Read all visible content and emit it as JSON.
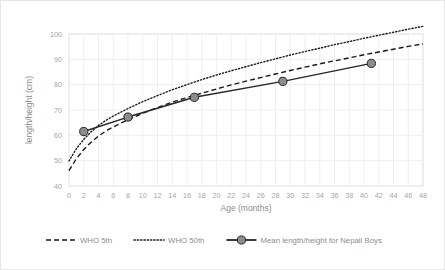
{
  "chart_data": {
    "type": "line",
    "title": "",
    "xlabel": "Age (months)",
    "ylabel": "length/height (cm)",
    "xlim": [
      0,
      48
    ],
    "ylim": [
      40,
      100
    ],
    "ytick_step": 10,
    "xtick_step": 2,
    "grid": "vertical-and-horizontal-light",
    "legend_position": "bottom",
    "xticks": [
      0,
      2,
      4,
      6,
      8,
      10,
      12,
      14,
      16,
      18,
      20,
      22,
      24,
      26,
      28,
      30,
      32,
      34,
      36,
      38,
      40,
      42,
      44,
      46,
      48
    ],
    "yticks": [
      40,
      50,
      60,
      70,
      80,
      90,
      100
    ],
    "series": [
      {
        "name": "WHO 5th",
        "style": "dashed",
        "color": "#1a1a1a",
        "x": [
          0,
          1,
          2,
          3,
          4,
          5,
          6,
          8,
          10,
          12,
          14,
          16,
          18,
          20,
          22,
          24,
          26,
          28,
          30,
          32,
          34,
          36,
          38,
          40,
          42,
          44,
          46,
          48
        ],
        "y": [
          46.1,
          50.8,
          54.4,
          57.3,
          59.7,
          61.7,
          63.3,
          66.2,
          68.7,
          71.0,
          73.1,
          74.9,
          76.6,
          78.3,
          79.9,
          81.4,
          82.8,
          84.2,
          85.6,
          86.9,
          88.2,
          89.4,
          90.6,
          91.8,
          92.9,
          94.0,
          95.1,
          96.1
        ]
      },
      {
        "name": "WHO 50th",
        "style": "dotted",
        "color": "#1a1a1a",
        "x": [
          0,
          1,
          2,
          3,
          4,
          5,
          6,
          8,
          10,
          12,
          14,
          16,
          18,
          20,
          22,
          24,
          26,
          28,
          30,
          32,
          34,
          36,
          38,
          40,
          42,
          44,
          46,
          48
        ],
        "y": [
          49.9,
          54.7,
          58.4,
          61.4,
          63.9,
          65.9,
          67.6,
          70.6,
          73.3,
          75.7,
          78.0,
          80.0,
          82.0,
          83.8,
          85.5,
          87.1,
          88.7,
          90.2,
          91.7,
          93.1,
          94.4,
          95.8,
          97.0,
          98.3,
          99.5,
          100.7,
          101.9,
          103.0
        ]
      },
      {
        "name": "Mean length/height for Nepali Boys",
        "style": "solid-markers",
        "color": "#262626",
        "marker_fill": "#8c8c8c",
        "x": [
          2,
          8,
          17,
          29,
          41
        ],
        "y": [
          61.5,
          67.2,
          75.0,
          81.3,
          88.4
        ]
      }
    ]
  },
  "legend": {
    "items": [
      {
        "label": "WHO 5th",
        "style": "dashed"
      },
      {
        "label": "WHO 50th",
        "style": "dotted"
      },
      {
        "label": "Mean length/height for Nepali Boys",
        "style": "solid-markers"
      }
    ]
  },
  "colors": {
    "line": "#1a1a1a",
    "marker": "#8c8c8c",
    "grid": "#eaeaea",
    "plot_border": "#d9d9d9",
    "text": "#8c8c8c",
    "tick_text": "#a6a6a6",
    "card_border": "#e6e6e6"
  }
}
